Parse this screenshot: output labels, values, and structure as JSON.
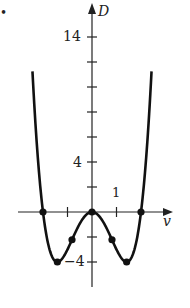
{
  "chart_data": {
    "type": "line",
    "title": "",
    "function": "D = v^4 - 4v^2",
    "xlabel": "v",
    "ylabel": "D",
    "xlim": [
      -3.6,
      3.9
    ],
    "ylim": [
      -6.5,
      17
    ],
    "x_ticks": [
      -1,
      1
    ],
    "x_tick_labels": [
      {
        "value": 1,
        "label": "1"
      }
    ],
    "y_ticks": [
      -4,
      -2,
      2,
      4,
      6,
      8,
      10,
      12,
      14
    ],
    "y_tick_labels": [
      {
        "value": 14,
        "label": "14"
      },
      {
        "value": 4,
        "label": "4"
      },
      {
        "value": -4,
        "label": "−4"
      }
    ],
    "grid": false,
    "series": [
      {
        "name": "D(v)",
        "x": [
          -2.43,
          -2.2,
          -2.0,
          -1.8,
          -1.6,
          -1.414,
          -1.2,
          -1.0,
          -0.816,
          -0.6,
          -0.4,
          -0.2,
          0,
          0.2,
          0.4,
          0.6,
          0.816,
          1.0,
          1.2,
          1.414,
          1.6,
          1.8,
          2.0,
          2.2,
          2.43
        ],
        "values": [
          11.26,
          4.07,
          0,
          -2.46,
          -3.69,
          -4,
          -3.69,
          -3,
          -2.22,
          -1.31,
          -0.62,
          -0.16,
          0,
          -0.16,
          -0.62,
          -1.31,
          -2.22,
          -3,
          -3.69,
          -4,
          -3.69,
          -2.46,
          0,
          4.07,
          11.26
        ]
      }
    ],
    "marked_points": [
      {
        "v": -2,
        "D": 0,
        "kind": "root"
      },
      {
        "v": 0,
        "D": 0,
        "kind": "local max / root"
      },
      {
        "v": 2,
        "D": 0,
        "kind": "root"
      },
      {
        "v": -1.414,
        "D": -4,
        "kind": "minimum"
      },
      {
        "v": 1.414,
        "D": -4,
        "kind": "minimum"
      },
      {
        "v": -0.816,
        "D": -2.22,
        "kind": "inflection"
      },
      {
        "v": 0.816,
        "D": -2.22,
        "kind": "inflection"
      }
    ]
  },
  "labels": {
    "y_axis": "D",
    "x_axis": "v",
    "tick_14": "14",
    "tick_4": "4",
    "tick_neg4": "−4",
    "tick_1": "1",
    "bullet": "•"
  }
}
